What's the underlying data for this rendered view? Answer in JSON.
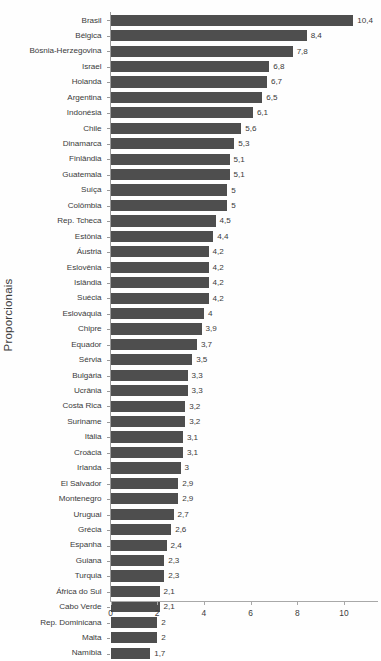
{
  "chart_data": {
    "type": "bar",
    "orientation": "horizontal",
    "title": "",
    "subtitle": "",
    "xlabel": "",
    "ylabel": "Proporcionais",
    "xlim": [
      0,
      11.5
    ],
    "xticks": [
      0,
      2,
      4,
      6,
      8,
      10
    ],
    "xtick_labels": [
      "0",
      "2",
      "4",
      "6",
      "8",
      "10"
    ],
    "grid": false,
    "legend": null,
    "decimal_separator": ",",
    "bar_color": "#4e4e4e",
    "axis_color": "#a8a8a8",
    "text_color": "#3b3b3b",
    "background": "#fefefe",
    "categories": [
      "Brasil",
      "Bélgica",
      "Bósnia-Herzegovina",
      "Israel",
      "Holanda",
      "Argentina",
      "Indonésia",
      "Chile",
      "Dinamarca",
      "Finlândia",
      "Guatemala",
      "Suíça",
      "Colômbia",
      "Rep. Tcheca",
      "Estônia",
      "Áustria",
      "Eslovênia",
      "Islândia",
      "Suécia",
      "Eslováquia",
      "Chipre",
      "Equador",
      "Sérvia",
      "Bulgária",
      "Ucrânia",
      "Costa Rica",
      "Suriname",
      "Itália",
      "Croácia",
      "Irlanda",
      "El Salvador",
      "Montenegro",
      "Uruguai",
      "Grécia",
      "Espanha",
      "Guiana",
      "Turquia",
      "África do Sul",
      "Cabo Verde",
      "Rep. Dominicana",
      "Malta",
      "Namíbia"
    ],
    "values": [
      10.4,
      8.4,
      7.8,
      6.8,
      6.7,
      6.5,
      6.1,
      5.6,
      5.3,
      5.1,
      5.1,
      5.0,
      5.0,
      4.5,
      4.4,
      4.2,
      4.2,
      4.2,
      4.2,
      4.0,
      3.9,
      3.7,
      3.5,
      3.3,
      3.3,
      3.2,
      3.2,
      3.1,
      3.1,
      3.0,
      2.9,
      2.9,
      2.7,
      2.6,
      2.4,
      2.3,
      2.3,
      2.1,
      2.1,
      2.0,
      2.0,
      1.7
    ],
    "value_labels": [
      "10,4",
      "8,4",
      "7,8",
      "6,8",
      "6,7",
      "6,5",
      "6,1",
      "5,6",
      "5,3",
      "5,1",
      "5,1",
      "5",
      "5",
      "4,5",
      "4,4",
      "4,2",
      "4,2",
      "4,2",
      "4,2",
      "4",
      "3,9",
      "3,7",
      "3,5",
      "3,3",
      "3,3",
      "3,2",
      "3,2",
      "3,1",
      "3,1",
      "3",
      "2,9",
      "2,9",
      "2,7",
      "2,6",
      "2,4",
      "2,3",
      "2,3",
      "2,1",
      "2,1",
      "2",
      "2",
      "1,7"
    ]
  }
}
